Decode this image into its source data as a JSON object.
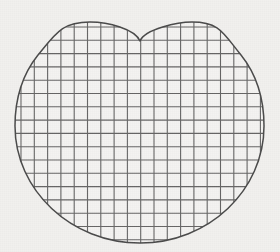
{
  "figure": {
    "background_color": "#f1f0ee",
    "line_color": "#5a5a5a",
    "outline_color": "#4a4a4a",
    "fill_color": "#f4f3f1",
    "shape_name": "heart-shape",
    "grid_name": "square-grid"
  },
  "chart_data": {
    "type": "diagram",
    "shape": {
      "kind": "heart",
      "description": "Circle with a downward cusp notch at the top center, two rounded lobes",
      "bounds": {
        "left": 15,
        "top": 20,
        "right": 264,
        "bottom": 243
      },
      "center_x": 140,
      "notch": {
        "x": 140,
        "y": 41
      },
      "left_lobe_peak": {
        "x": 90,
        "y": 22
      },
      "right_lobe_peak": {
        "x": 192,
        "y": 22
      },
      "widest_y": 126
    },
    "grid": {
      "cell_size": 13.3,
      "origin_x": 21,
      "origin_y": 27,
      "vertical_line_count": 19,
      "horizontal_line_count": 17,
      "stroke_width": 1.1,
      "color": "#5a5a5a"
    },
    "xlabel": "",
    "ylabel": "",
    "legend": [],
    "annotations": []
  }
}
